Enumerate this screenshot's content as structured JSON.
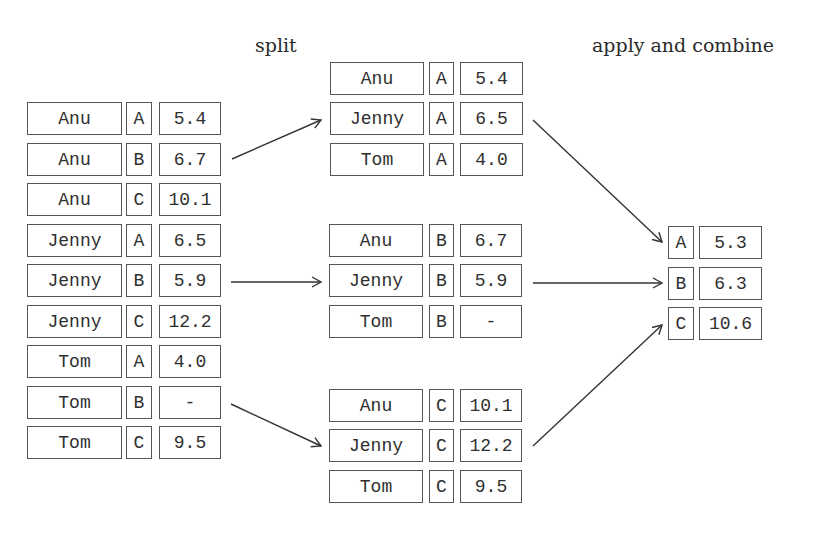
{
  "labels": {
    "split": "split",
    "apply_combine": "apply and combine"
  },
  "original_table": [
    {
      "name": "Anu",
      "key": "A",
      "value": "5.4"
    },
    {
      "name": "Anu",
      "key": "B",
      "value": "6.7"
    },
    {
      "name": "Anu",
      "key": "C",
      "value": "10.1"
    },
    {
      "name": "Jenny",
      "key": "A",
      "value": "6.5"
    },
    {
      "name": "Jenny",
      "key": "B",
      "value": "5.9"
    },
    {
      "name": "Jenny",
      "key": "C",
      "value": "12.2"
    },
    {
      "name": "Tom",
      "key": "A",
      "value": "4.0"
    },
    {
      "name": "Tom",
      "key": "B",
      "value": "-"
    },
    {
      "name": "Tom",
      "key": "C",
      "value": "9.5"
    }
  ],
  "split_groups": [
    {
      "key": "A",
      "rows": [
        {
          "name": "Anu",
          "key": "A",
          "value": "5.4"
        },
        {
          "name": "Jenny",
          "key": "A",
          "value": "6.5"
        },
        {
          "name": "Tom",
          "key": "A",
          "value": "4.0"
        }
      ]
    },
    {
      "key": "B",
      "rows": [
        {
          "name": "Anu",
          "key": "B",
          "value": "6.7"
        },
        {
          "name": "Jenny",
          "key": "B",
          "value": "5.9"
        },
        {
          "name": "Tom",
          "key": "B",
          "value": "-"
        }
      ]
    },
    {
      "key": "C",
      "rows": [
        {
          "name": "Anu",
          "key": "C",
          "value": "10.1"
        },
        {
          "name": "Jenny",
          "key": "C",
          "value": "12.2"
        },
        {
          "name": "Tom",
          "key": "C",
          "value": "9.5"
        }
      ]
    }
  ],
  "combined_result": [
    {
      "key": "A",
      "value": "5.3"
    },
    {
      "key": "B",
      "value": "6.3"
    },
    {
      "key": "C",
      "value": "10.6"
    }
  ],
  "colors": {
    "stroke": "#555555",
    "text": "#2f2f2f",
    "arrow": "#333333"
  }
}
